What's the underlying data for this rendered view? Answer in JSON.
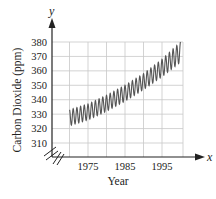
{
  "chart_data": {
    "type": "line",
    "title": "",
    "xlabel": "Year",
    "ylabel": "Carbon Dioxide (ppm)",
    "x_axis_variable": "x",
    "y_axis_variable": "y",
    "xlim": [
      1965,
      2000
    ],
    "ylim": [
      305,
      380
    ],
    "x_ticks": [
      1975,
      1985,
      1995
    ],
    "y_ticks": [
      310,
      320,
      330,
      340,
      350,
      360,
      370,
      380
    ],
    "grid": true,
    "axis_break": true,
    "legend": null,
    "series": [
      {
        "name": "CO2 seasonal oscillation",
        "style": "dense oscillating line (annual seasonal cycle)",
        "x_start": 1970,
        "x_end": 2000,
        "cycles_per_year": 1,
        "trend_low": {
          "x": [
            1970,
            1975,
            1980,
            1985,
            1990,
            1995,
            2000
          ],
          "values": [
            322,
            326,
            332,
            339,
            347,
            356,
            366
          ]
        },
        "trend_high": {
          "x": [
            1970,
            1975,
            1980,
            1985,
            1990,
            1995,
            2000
          ],
          "values": [
            333,
            337,
            343,
            350,
            358,
            368,
            380
          ]
        }
      }
    ]
  },
  "colors": {
    "axis": "#222222",
    "grid": "#c8c8c8",
    "series": "#555555",
    "text": "#222222"
  }
}
